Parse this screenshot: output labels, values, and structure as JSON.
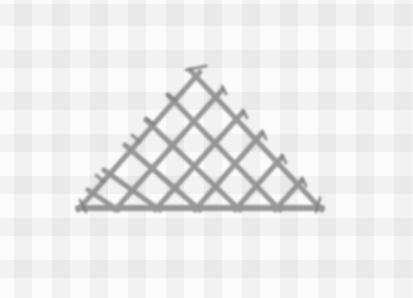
{
  "image": {
    "subject": "cross-stitch triangle embroidered on checkered fabric",
    "colors": {
      "fabric": "#fbfbfb",
      "grid": "#eeeeee",
      "thread": "#8a8a8a",
      "thread_dark": "#6f6f6f"
    },
    "triangle": {
      "apex": [
        200,
        70
      ],
      "base_left": [
        78,
        210
      ],
      "base_right": [
        322,
        210
      ],
      "rows": 5
    }
  }
}
